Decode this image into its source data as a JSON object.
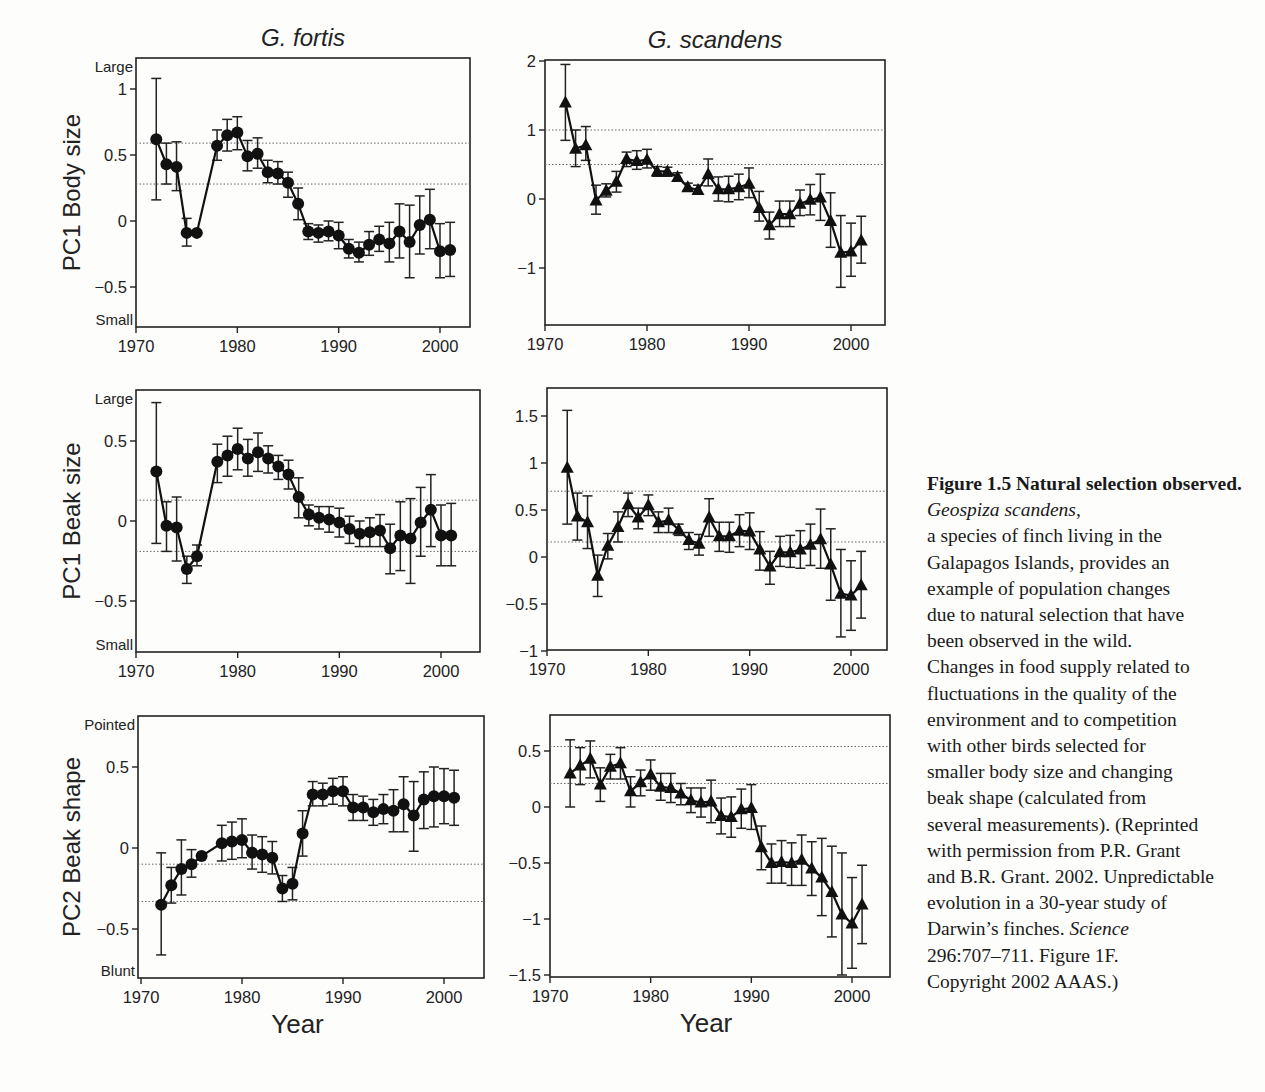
{
  "figure": {
    "column_titles": [
      "G. fortis",
      "G. scandens"
    ],
    "row_labels": [
      "PC1 Body size",
      "PC1 Beak size",
      "PC2 Beak shape"
    ],
    "xlabel": "Year"
  },
  "caption": {
    "title": "Figure 1.5  Natural selection observed.",
    "species": "Geospiza scandens",
    "lines": [
      "a species of finch living in the",
      "Galapagos Islands, provides an",
      "example of population changes",
      "due to natural selection that have",
      "been observed in the wild.",
      "Changes in food supply related to",
      "fluctuations in the quality of the",
      "environment and to competition",
      "with other birds selected for",
      "smaller body size and changing",
      "beak shape (calculated from",
      "several measurements). (Reprinted",
      "with permission from P.R. Grant",
      "and B.R. Grant. 2002. Unpredictable",
      "evolution in a 30-year study of"
    ],
    "line_pre_journal": "Darwin’s finches.",
    "journal": "Science",
    "line_after": [
      "296:707–711. Figure 1F.",
      "Copyright 2002 AAAS.)"
    ]
  },
  "chart_data": [
    {
      "id": "fortis-body",
      "type": "line",
      "title": "G. fortis",
      "ylabel": "PC1 Body size",
      "xlabel": "",
      "marker": "circle",
      "top_label": "Large",
      "bottom_label": "Small",
      "frame": {
        "x0": 136,
        "x1": 470,
        "y0": 58,
        "y1": 327
      },
      "xmap": {
        "x1970": 136,
        "x2000": 440
      },
      "ymap": {
        "v_a": 1,
        "y_a": 89,
        "v_b": 0,
        "y_b": 221
      },
      "xticks": [
        1970,
        1980,
        1990,
        2000
      ],
      "yticks": [
        {
          "v": 1,
          "label": "1"
        },
        {
          "v": 0.5,
          "label": "0.5"
        },
        {
          "v": 0,
          "label": "0"
        },
        {
          "v": -0.5,
          "label": "−0.5"
        }
      ],
      "ref_lines": [
        0.59,
        0.28
      ],
      "x": [
        1972,
        1973,
        1974,
        1975,
        1976,
        1978,
        1979,
        1980,
        1981,
        1982,
        1983,
        1984,
        1985,
        1986,
        1987,
        1988,
        1989,
        1990,
        1991,
        1992,
        1993,
        1994,
        1995,
        1996,
        1997,
        1998,
        1999,
        2000,
        2001
      ],
      "values": [
        0.62,
        0.43,
        0.41,
        -0.09,
        -0.09,
        0.57,
        0.65,
        0.67,
        0.49,
        0.51,
        0.37,
        0.36,
        0.29,
        0.13,
        -0.08,
        -0.09,
        -0.08,
        -0.11,
        -0.21,
        -0.24,
        -0.18,
        -0.14,
        -0.17,
        -0.08,
        -0.16,
        -0.03,
        0.01,
        -0.23,
        -0.22
      ],
      "err_hi": [
        1.08,
        0.59,
        0.6,
        0.02,
        -0.09,
        0.69,
        0.77,
        0.79,
        0.61,
        0.63,
        0.46,
        0.45,
        0.37,
        0.25,
        -0.02,
        -0.03,
        0.0,
        -0.01,
        -0.14,
        -0.16,
        -0.08,
        -0.04,
        -0.01,
        0.13,
        0.12,
        0.19,
        0.24,
        -0.02,
        -0.01
      ],
      "err_lo": [
        0.16,
        0.28,
        0.23,
        -0.19,
        -0.09,
        0.46,
        0.53,
        0.54,
        0.38,
        0.4,
        0.29,
        0.28,
        0.18,
        0.01,
        -0.14,
        -0.16,
        -0.15,
        -0.21,
        -0.28,
        -0.31,
        -0.26,
        -0.23,
        -0.31,
        -0.28,
        -0.43,
        -0.25,
        -0.21,
        -0.43,
        -0.42
      ]
    },
    {
      "id": "scandens-body",
      "type": "line",
      "title": "G. scandens",
      "ylabel": "",
      "xlabel": "",
      "marker": "triangle",
      "frame": {
        "x0": 545,
        "x1": 885,
        "y0": 60,
        "y1": 325
      },
      "xmap": {
        "x1970": 545,
        "x2000": 851
      },
      "ymap": {
        "v_a": 2,
        "y_a": 61,
        "v_b": 0,
        "y_b": 199
      },
      "xticks": [
        1970,
        1980,
        1990,
        2000
      ],
      "yticks": [
        {
          "v": 2,
          "label": "2"
        },
        {
          "v": 1,
          "label": "1"
        },
        {
          "v": 0,
          "label": "0"
        },
        {
          "v": -1,
          "label": "−1"
        }
      ],
      "ref_lines": [
        1.0,
        0.5
      ],
      "x": [
        1972,
        1973,
        1974,
        1975,
        1976,
        1977,
        1978,
        1979,
        1980,
        1981,
        1982,
        1983,
        1984,
        1985,
        1986,
        1987,
        1988,
        1989,
        1990,
        1991,
        1992,
        1993,
        1994,
        1995,
        1996,
        1997,
        1998,
        1999,
        2000,
        2001
      ],
      "values": [
        1.4,
        0.73,
        0.78,
        -0.02,
        0.12,
        0.25,
        0.58,
        0.55,
        0.57,
        0.4,
        0.4,
        0.32,
        0.17,
        0.13,
        0.36,
        0.14,
        0.14,
        0.17,
        0.22,
        -0.13,
        -0.38,
        -0.22,
        -0.22,
        -0.07,
        -0.01,
        0.02,
        -0.32,
        -0.78,
        -0.76,
        -0.6
      ],
      "err_hi": [
        1.95,
        1.0,
        1.05,
        0.2,
        0.22,
        0.4,
        0.68,
        0.7,
        0.72,
        0.47,
        0.46,
        0.38,
        0.23,
        0.2,
        0.58,
        0.32,
        0.33,
        0.36,
        0.45,
        0.11,
        -0.19,
        -0.03,
        -0.03,
        0.13,
        0.21,
        0.36,
        0.09,
        -0.24,
        -0.35,
        -0.25
      ],
      "err_lo": [
        0.85,
        0.47,
        0.56,
        -0.22,
        0.03,
        0.1,
        0.47,
        0.43,
        0.45,
        0.33,
        0.33,
        0.26,
        0.12,
        0.07,
        0.19,
        -0.03,
        -0.04,
        -0.01,
        0.02,
        -0.32,
        -0.58,
        -0.4,
        -0.4,
        -0.24,
        -0.23,
        -0.31,
        -0.7,
        -1.28,
        -1.12,
        -0.93
      ]
    },
    {
      "id": "fortis-beak-size",
      "type": "line",
      "title": "",
      "ylabel": "PC1 Beak size",
      "xlabel": "",
      "marker": "circle",
      "top_label": "Large",
      "bottom_label": "Small",
      "frame": {
        "x0": 136,
        "x1": 480,
        "y0": 390,
        "y1": 652
      },
      "xmap": {
        "x1970": 136,
        "x2000": 441
      },
      "ymap": {
        "v_a": 0.5,
        "y_a": 441,
        "v_b": 0,
        "y_b": 521
      },
      "xticks": [
        1970,
        1980,
        1990,
        2000
      ],
      "yticks": [
        {
          "v": 0.5,
          "label": "0.5"
        },
        {
          "v": 0,
          "label": "0"
        },
        {
          "v": -0.5,
          "label": "−0.5"
        }
      ],
      "ref_lines": [
        0.13,
        -0.19
      ],
      "x": [
        1972,
        1973,
        1974,
        1975,
        1976,
        1978,
        1979,
        1980,
        1981,
        1982,
        1983,
        1984,
        1985,
        1986,
        1987,
        1988,
        1989,
        1990,
        1991,
        1992,
        1993,
        1994,
        1995,
        1996,
        1997,
        1998,
        1999,
        2000,
        2001
      ],
      "values": [
        0.31,
        -0.03,
        -0.04,
        -0.3,
        -0.22,
        0.37,
        0.41,
        0.45,
        0.39,
        0.43,
        0.39,
        0.34,
        0.29,
        0.15,
        0.04,
        0.02,
        0.01,
        -0.01,
        -0.05,
        -0.08,
        -0.07,
        -0.06,
        -0.17,
        -0.09,
        -0.11,
        -0.01,
        0.07,
        -0.09,
        -0.09
      ],
      "err_hi": [
        0.74,
        0.12,
        0.15,
        -0.22,
        -0.15,
        0.48,
        0.53,
        0.58,
        0.51,
        0.55,
        0.47,
        0.41,
        0.38,
        0.27,
        0.1,
        0.09,
        0.09,
        0.08,
        0.03,
        0.0,
        0.02,
        0.04,
        -0.02,
        0.12,
        0.14,
        0.21,
        0.29,
        0.1,
        0.11
      ],
      "err_lo": [
        -0.14,
        -0.19,
        -0.25,
        -0.39,
        -0.28,
        0.24,
        0.28,
        0.32,
        0.28,
        0.31,
        0.3,
        0.26,
        0.2,
        0.02,
        -0.03,
        -0.05,
        -0.07,
        -0.1,
        -0.14,
        -0.16,
        -0.16,
        -0.16,
        -0.33,
        -0.31,
        -0.39,
        -0.22,
        -0.16,
        -0.28,
        -0.28
      ]
    },
    {
      "id": "scandens-beak-size",
      "type": "line",
      "title": "",
      "ylabel": "",
      "xlabel": "",
      "marker": "triangle",
      "frame": {
        "x0": 547,
        "x1": 887,
        "y0": 388,
        "y1": 650
      },
      "xmap": {
        "x1970": 547,
        "x2000": 851
      },
      "ymap": {
        "v_a": 1,
        "y_a": 463,
        "v_b": 0,
        "y_b": 557
      },
      "xticks": [
        1970,
        1980,
        1990,
        2000
      ],
      "yticks": [
        {
          "v": 1.5,
          "label": "1.5"
        },
        {
          "v": 1,
          "label": "1"
        },
        {
          "v": 0.5,
          "label": "0.5"
        },
        {
          "v": 0,
          "label": "0"
        },
        {
          "v": -0.5,
          "label": "−0.5"
        },
        {
          "v": -1,
          "label": "−1"
        }
      ],
      "ref_lines": [
        0.7,
        0.16
      ],
      "x": [
        1972,
        1973,
        1974,
        1975,
        1976,
        1977,
        1978,
        1979,
        1980,
        1981,
        1982,
        1983,
        1984,
        1985,
        1986,
        1987,
        1988,
        1989,
        1990,
        1991,
        1992,
        1993,
        1994,
        1995,
        1996,
        1997,
        1998,
        1999,
        2000,
        2001
      ],
      "values": [
        0.95,
        0.43,
        0.37,
        -0.2,
        0.12,
        0.32,
        0.56,
        0.42,
        0.55,
        0.37,
        0.39,
        0.29,
        0.18,
        0.14,
        0.42,
        0.22,
        0.22,
        0.28,
        0.27,
        0.08,
        -0.1,
        0.05,
        0.05,
        0.08,
        0.13,
        0.19,
        -0.08,
        -0.39,
        -0.41,
        -0.3
      ],
      "err_hi": [
        1.56,
        0.68,
        0.65,
        0.02,
        0.25,
        0.48,
        0.68,
        0.52,
        0.66,
        0.48,
        0.52,
        0.35,
        0.26,
        0.24,
        0.62,
        0.37,
        0.37,
        0.45,
        0.47,
        0.27,
        0.06,
        0.22,
        0.23,
        0.28,
        0.35,
        0.51,
        0.3,
        0.08,
        -0.04,
        0.06
      ],
      "err_lo": [
        0.35,
        0.18,
        0.09,
        -0.42,
        -0.02,
        0.16,
        0.43,
        0.3,
        0.44,
        0.26,
        0.26,
        0.23,
        0.08,
        0.02,
        0.22,
        0.06,
        0.05,
        0.11,
        0.08,
        -0.14,
        -0.29,
        -0.1,
        -0.11,
        -0.12,
        -0.09,
        -0.12,
        -0.46,
        -0.85,
        -0.78,
        -0.65
      ]
    },
    {
      "id": "fortis-beak-shape",
      "type": "line",
      "title": "",
      "ylabel": "PC2 Beak shape",
      "xlabel": "Year",
      "marker": "circle",
      "top_label": "Pointed",
      "bottom_label": "Blunt",
      "frame": {
        "x0": 138,
        "x1": 484,
        "y0": 716,
        "y1": 978
      },
      "xmap": {
        "x1970": 141,
        "x2000": 444
      },
      "ymap": {
        "v_a": 0.5,
        "y_a": 767,
        "v_b": 0,
        "y_b": 848
      },
      "xticks": [
        1970,
        1980,
        1990,
        2000
      ],
      "yticks": [
        {
          "v": 0.5,
          "label": "0.5"
        },
        {
          "v": 0,
          "label": "0"
        },
        {
          "v": -0.5,
          "label": "−0.5"
        }
      ],
      "ref_lines": [
        -0.1,
        -0.33
      ],
      "x": [
        1972,
        1973,
        1974,
        1975,
        1976,
        1978,
        1979,
        1980,
        1981,
        1982,
        1983,
        1984,
        1985,
        1986,
        1987,
        1988,
        1989,
        1990,
        1991,
        1992,
        1993,
        1994,
        1995,
        1996,
        1997,
        1998,
        1999,
        2000,
        2001
      ],
      "values": [
        -0.35,
        -0.23,
        -0.13,
        -0.1,
        -0.05,
        0.03,
        0.04,
        0.05,
        -0.03,
        -0.04,
        -0.06,
        -0.25,
        -0.22,
        0.09,
        0.33,
        0.33,
        0.35,
        0.35,
        0.25,
        0.25,
        0.22,
        0.24,
        0.23,
        0.27,
        0.2,
        0.3,
        0.32,
        0.32,
        0.31
      ],
      "err_hi": [
        -0.03,
        -0.12,
        0.05,
        -0.01,
        -0.05,
        0.14,
        0.16,
        0.18,
        0.08,
        0.07,
        0.04,
        -0.17,
        -0.12,
        0.23,
        0.41,
        0.4,
        0.43,
        0.44,
        0.33,
        0.32,
        0.3,
        0.33,
        0.36,
        0.44,
        0.41,
        0.47,
        0.5,
        0.49,
        0.48
      ],
      "err_lo": [
        -0.66,
        -0.34,
        -0.29,
        -0.18,
        -0.05,
        -0.08,
        -0.07,
        -0.06,
        -0.13,
        -0.15,
        -0.16,
        -0.33,
        -0.32,
        -0.05,
        0.26,
        0.26,
        0.27,
        0.26,
        0.17,
        0.17,
        0.14,
        0.15,
        0.1,
        0.1,
        -0.02,
        0.12,
        0.13,
        0.15,
        0.14
      ]
    },
    {
      "id": "scandens-beak-shape",
      "type": "line",
      "title": "",
      "ylabel": "",
      "xlabel": "Year",
      "marker": "triangle",
      "frame": {
        "x0": 550,
        "x1": 890,
        "y0": 715,
        "y1": 977
      },
      "xmap": {
        "x1970": 550,
        "x2000": 852
      },
      "ymap": {
        "v_a": 0.5,
        "y_a": 751,
        "v_b": -1,
        "y_b": 919
      },
      "xticks": [
        1970,
        1980,
        1990,
        2000
      ],
      "yticks": [
        {
          "v": 0.5,
          "label": "0.5"
        },
        {
          "v": 0,
          "label": "0"
        },
        {
          "v": -0.5,
          "label": "−0.5"
        },
        {
          "v": -1,
          "label": "−1"
        },
        {
          "v": -1.5,
          "label": "−1.5"
        }
      ],
      "ref_lines": [
        0.54,
        0.21
      ],
      "x": [
        1972,
        1973,
        1974,
        1975,
        1976,
        1977,
        1978,
        1979,
        1980,
        1981,
        1982,
        1983,
        1984,
        1985,
        1986,
        1987,
        1988,
        1989,
        1990,
        1991,
        1992,
        1993,
        1994,
        1995,
        1996,
        1997,
        1998,
        1999,
        2000,
        2001
      ],
      "values": [
        0.3,
        0.37,
        0.43,
        0.2,
        0.36,
        0.39,
        0.14,
        0.22,
        0.29,
        0.18,
        0.17,
        0.12,
        0.06,
        0.04,
        0.05,
        -0.08,
        -0.09,
        -0.02,
        -0.01,
        -0.36,
        -0.5,
        -0.49,
        -0.5,
        -0.47,
        -0.55,
        -0.63,
        -0.76,
        -0.96,
        -1.04,
        -0.87
      ],
      "err_hi": [
        0.6,
        0.53,
        0.59,
        0.35,
        0.47,
        0.53,
        0.27,
        0.33,
        0.42,
        0.3,
        0.3,
        0.21,
        0.17,
        0.17,
        0.24,
        0.08,
        0.09,
        0.16,
        0.2,
        -0.17,
        -0.33,
        -0.3,
        -0.32,
        -0.25,
        -0.31,
        -0.28,
        -0.35,
        -0.41,
        -0.63,
        -0.52
      ],
      "err_lo": [
        0.0,
        0.2,
        0.26,
        0.05,
        0.25,
        0.25,
        0.0,
        0.1,
        0.15,
        0.06,
        0.04,
        0.02,
        -0.05,
        -0.09,
        -0.14,
        -0.24,
        -0.27,
        -0.19,
        -0.2,
        -0.56,
        -0.68,
        -0.68,
        -0.7,
        -0.7,
        -0.79,
        -0.97,
        -1.16,
        -1.5,
        -1.44,
        -1.22
      ]
    }
  ]
}
